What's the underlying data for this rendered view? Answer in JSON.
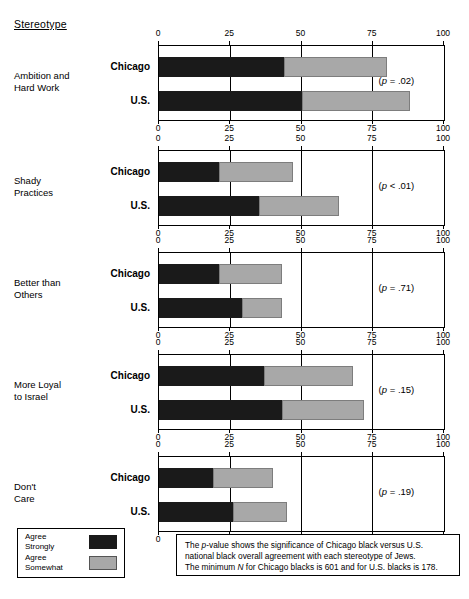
{
  "header": {
    "stereotype_label": "Stereotype"
  },
  "axis": {
    "title": "Percentage",
    "ticks": [
      0,
      25,
      50,
      75,
      100
    ],
    "tick_labels": [
      "0",
      "25",
      "50",
      "75",
      "100"
    ],
    "min": 0,
    "max": 100
  },
  "series_names": {
    "chicago": "Chicago",
    "us": "U.S."
  },
  "legend": {
    "items": [
      {
        "label_line1": "Agree",
        "label_line2": "Strongly",
        "key": "strong"
      },
      {
        "label_line1": "Agree",
        "label_line2": "Somewhat",
        "key": "somewhat"
      }
    ]
  },
  "footnote": {
    "line1_a": "The ",
    "line1_p": "p",
    "line1_b": "-value shows the significance of Chicago black versus U.S.",
    "line2": "national black overall agreement with each stereotype of Jews.",
    "line3_a": "The minimum ",
    "line3_n": "N",
    "line3_b": " for Chicago blacks is 601 and for U.S. blacks is 178."
  },
  "colors": {
    "agree_strongly": "#1a1a1a",
    "agree_somewhat": "#a8a8a8",
    "axis": "#000000",
    "background": "#ffffff"
  },
  "chart_data": {
    "type": "bar",
    "orientation": "horizontal",
    "stacked": true,
    "title": "",
    "xlabel": "Percentage",
    "ylabel": "Stereotype",
    "xlim": [
      0,
      100
    ],
    "grid": true,
    "legend_position": "bottom-left",
    "series": [
      {
        "name": "Agree Strongly",
        "color": "#1a1a1a"
      },
      {
        "name": "Agree Somewhat",
        "color": "#a8a8a8"
      }
    ],
    "panels": [
      {
        "category_line1": "Ambition and",
        "category_line2": "Hard Work",
        "p_prefix": "(",
        "p_italic": "p",
        "p_value": " = .02)",
        "groups": [
          {
            "name": "Chicago",
            "agree_strongly": 44,
            "agree_somewhat": 36,
            "total": 80
          },
          {
            "name": "U.S.",
            "agree_strongly": 50,
            "agree_somewhat": 38,
            "total": 88
          }
        ]
      },
      {
        "category_line1": "Shady",
        "category_line2": "Practices",
        "p_prefix": "(",
        "p_italic": "p",
        "p_value": " < .01)",
        "groups": [
          {
            "name": "Chicago",
            "agree_strongly": 21,
            "agree_somewhat": 26,
            "total": 47
          },
          {
            "name": "U.S.",
            "agree_strongly": 35,
            "agree_somewhat": 28,
            "total": 63
          }
        ]
      },
      {
        "category_line1": "Better than",
        "category_line2": "Others",
        "p_prefix": "(",
        "p_italic": "p",
        "p_value": " = .71)",
        "groups": [
          {
            "name": "Chicago",
            "agree_strongly": 21,
            "agree_somewhat": 22,
            "total": 43
          },
          {
            "name": "U.S.",
            "agree_strongly": 29,
            "agree_somewhat": 14,
            "total": 43
          }
        ]
      },
      {
        "category_line1": "More Loyal",
        "category_line2": "to Israel",
        "p_prefix": "(",
        "p_italic": "p",
        "p_value": " = .15)",
        "groups": [
          {
            "name": "Chicago",
            "agree_strongly": 37,
            "agree_somewhat": 31,
            "total": 68
          },
          {
            "name": "U.S.",
            "agree_strongly": 43,
            "agree_somewhat": 29,
            "total": 72
          }
        ]
      },
      {
        "category_line1": "Don't",
        "category_line2": "Care",
        "p_prefix": "(",
        "p_italic": "p",
        "p_value": " = .19)",
        "groups": [
          {
            "name": "Chicago",
            "agree_strongly": 19,
            "agree_somewhat": 21,
            "total": 40
          },
          {
            "name": "U.S.",
            "agree_strongly": 26,
            "agree_somewhat": 19,
            "total": 45
          }
        ]
      }
    ]
  }
}
